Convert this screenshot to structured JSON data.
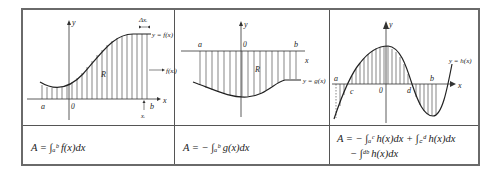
{
  "panels": [
    {
      "id": "positive-region",
      "labels": {
        "y_axis": "y",
        "x_axis": "x",
        "origin": "0",
        "a": "a",
        "b": "b",
        "region": "R",
        "curve": "y = f(x)",
        "delta_x": "Δxᵢ",
        "xi": "xᵢ",
        "height": "f(xᵢ)"
      },
      "formula": "A = ∫ₐᵇ f(x)dx"
    },
    {
      "id": "negative-region",
      "labels": {
        "y_axis": "y",
        "x_axis": "x",
        "origin": "0",
        "a": "a",
        "b": "b",
        "region": "R",
        "curve": "y = g(x)"
      },
      "formula": "A = − ∫ₐᵇ g(x)dx"
    },
    {
      "id": "mixed-region",
      "labels": {
        "y_axis": "y",
        "x_axis": "x",
        "origin": "0",
        "a": "a",
        "b": "b",
        "c": "c",
        "d": "d",
        "curve": "y = h(x)"
      },
      "formula_line1": "A = − ∫ₐᶜ h(x)dx + ∫꜀ᵈ h(x)dx",
      "formula_line2": "− ∫ᵈᵇ h(x)dx"
    }
  ],
  "colors": {
    "border": "#6a6a6a",
    "ink": "#222222",
    "hatch": "#333333"
  }
}
